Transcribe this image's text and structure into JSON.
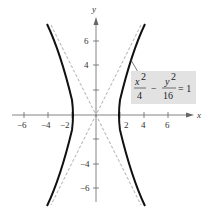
{
  "diagram": {
    "type": "hyperbola-graph",
    "equation": {
      "num1": "x",
      "sup1": "2",
      "den1": "4",
      "minus": "−",
      "num2": "y",
      "sup2": "2",
      "den2": "16",
      "equals": "= 1"
    },
    "axes": {
      "x_label": "x",
      "y_label": "y",
      "x_ticks": [
        "−6",
        "−4",
        "−2",
        "2",
        "4",
        "6"
      ],
      "y_ticks": [
        "6",
        "4",
        "−4",
        "−6"
      ]
    },
    "colors": {
      "curve": "#111111",
      "asymptote": "#888888",
      "axis": "#555555",
      "label_box": "#e2e2e2"
    }
  }
}
